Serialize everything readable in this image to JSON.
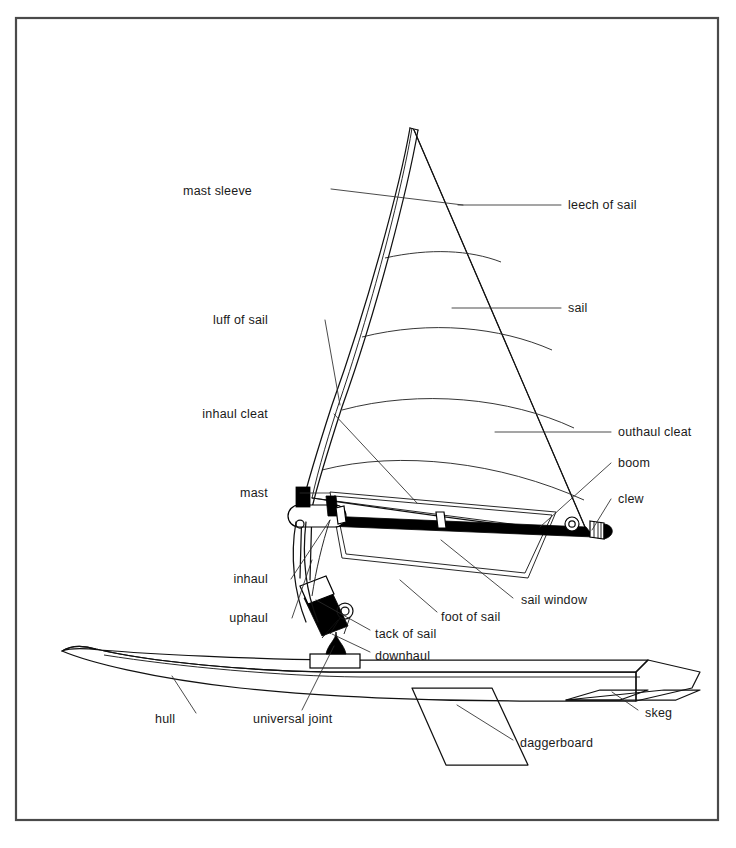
{
  "figure": {
    "style": "line-art technical illustration",
    "border_color": "#4a4a4a",
    "line_color": "#111111",
    "background_color": "#ffffff"
  },
  "labels": {
    "mast_sleeve": "mast sleeve",
    "leech_of_sail": "leech of sail",
    "luff_of_sail": "luff of sail",
    "sail": "sail",
    "inhaul_cleat": "inhaul cleat",
    "outhaul_cleat": "outhaul cleat",
    "boom": "boom",
    "mast": "mast",
    "clew": "clew",
    "inhaul": "inhaul",
    "uphaul": "uphaul",
    "sail_window": "sail window",
    "foot_of_sail": "foot of sail",
    "tack_of_sail": "tack of sail",
    "downhaul": "downhaul",
    "hull": "hull",
    "universal_joint": "universal joint",
    "skeg": "skeg",
    "daggerboard": "daggerboard"
  },
  "callouts": [
    {
      "key": "mast_sleeve",
      "text": "mast sleeve",
      "side": "left",
      "x": 252,
      "y": 191
    },
    {
      "key": "leech_of_sail",
      "text": "leech of sail",
      "side": "right",
      "x": 568,
      "y": 205
    },
    {
      "key": "luff_of_sail",
      "text": "luff of sail",
      "side": "left",
      "x": 268,
      "y": 320
    },
    {
      "key": "sail",
      "text": "sail",
      "side": "right",
      "x": 568,
      "y": 308
    },
    {
      "key": "inhaul_cleat",
      "text": "inhaul cleat",
      "side": "left",
      "x": 268,
      "y": 414
    },
    {
      "key": "outhaul_cleat",
      "text": "outhaul cleat",
      "side": "right",
      "x": 618,
      "y": 432
    },
    {
      "key": "boom",
      "text": "boom",
      "side": "right",
      "x": 618,
      "y": 463
    },
    {
      "key": "mast",
      "text": "mast",
      "side": "left",
      "x": 268,
      "y": 493
    },
    {
      "key": "clew",
      "text": "clew",
      "side": "right",
      "x": 618,
      "y": 499
    },
    {
      "key": "inhaul",
      "text": "inhaul",
      "side": "left",
      "x": 268,
      "y": 579
    },
    {
      "key": "uphaul",
      "text": "uphaul",
      "side": "left",
      "x": 268,
      "y": 618
    },
    {
      "key": "sail_window",
      "text": "sail window",
      "side": "right",
      "x": 521,
      "y": 600
    },
    {
      "key": "foot_of_sail",
      "text": "foot of sail",
      "side": "right",
      "x": 441,
      "y": 617
    },
    {
      "key": "tack_of_sail",
      "text": "tack of sail",
      "side": "right",
      "x": 375,
      "y": 634
    },
    {
      "key": "downhaul",
      "text": "downhaul",
      "side": "right",
      "x": 375,
      "y": 656
    },
    {
      "key": "hull",
      "text": "hull",
      "side": "left",
      "x": 155,
      "y": 719
    },
    {
      "key": "universal_joint",
      "text": "universal joint",
      "side": "left",
      "x": 253,
      "y": 719
    },
    {
      "key": "skeg",
      "text": "skeg",
      "side": "right",
      "x": 645,
      "y": 713
    },
    {
      "key": "daggerboard",
      "text": "daggerboard",
      "side": "right",
      "x": 520,
      "y": 743
    }
  ],
  "parts": {
    "rig": [
      "mast",
      "mast sleeve",
      "boom",
      "sail",
      "uphaul",
      "inhaul",
      "downhaul",
      "outhaul cleat",
      "inhaul cleat",
      "universal joint"
    ],
    "sail_edges": [
      "luff of sail",
      "leech of sail",
      "foot of sail",
      "tack of sail",
      "clew",
      "sail window"
    ],
    "board": [
      "hull",
      "daggerboard",
      "skeg"
    ]
  }
}
